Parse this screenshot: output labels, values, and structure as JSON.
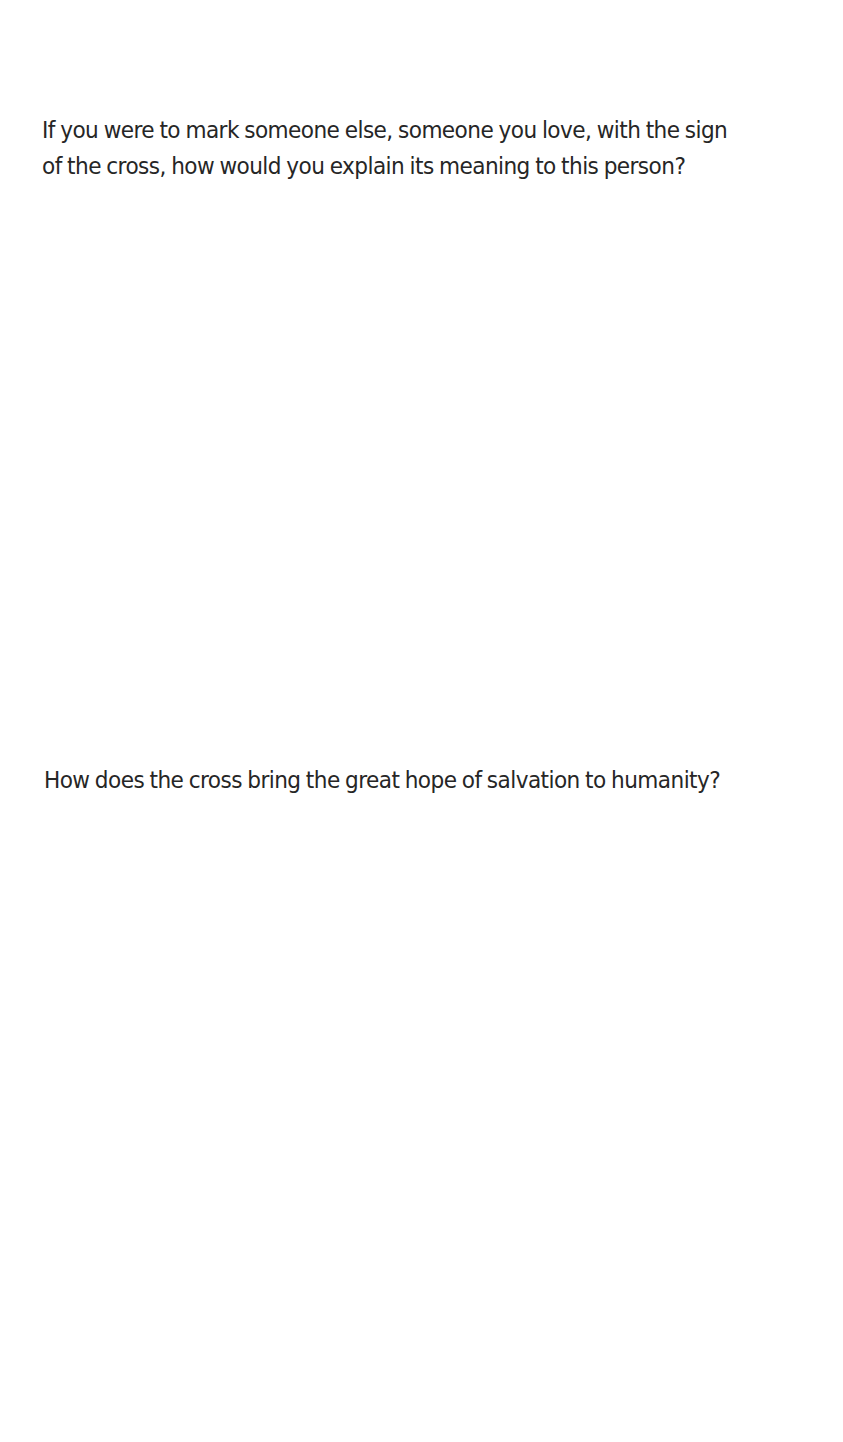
{
  "page": {
    "questions": [
      {
        "lines": [
          "If you were to mark someone else, someone you love, with the sign",
          "of the cross, how would you explain its meaning to this person?"
        ]
      },
      {
        "lines": [
          "How does the cross bring the great hope of salvation to humanity?"
        ]
      }
    ]
  }
}
